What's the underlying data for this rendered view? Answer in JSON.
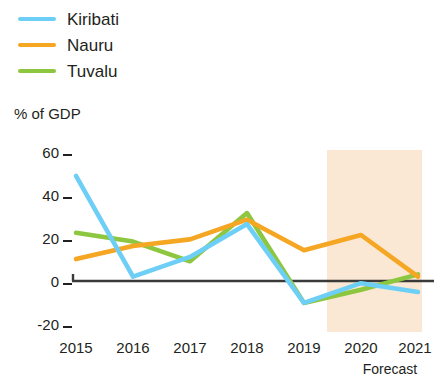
{
  "legend": {
    "items": [
      {
        "label": "Kiribati",
        "color": "#6ecff6"
      },
      {
        "label": "Nauru",
        "color": "#f5a623"
      },
      {
        "label": "Tuvalu",
        "color": "#8dc63f"
      }
    ]
  },
  "axis": {
    "unit_label": "% of GDP",
    "y_ticks": [
      "60",
      "40",
      "20",
      "0",
      "-20"
    ],
    "x_ticks": [
      "2015",
      "2016",
      "2017",
      "2018",
      "2019",
      "2020",
      "2021"
    ],
    "forecast_label": "Forecast"
  },
  "colors": {
    "kiribati": "#6ecff6",
    "nauru": "#f5a623",
    "tuvalu": "#8dc63f",
    "zero_axis": "#3a3a38",
    "forecast_band": "#fae8d4",
    "text": "#231f20"
  },
  "chart_data": {
    "type": "line",
    "title": "",
    "subtitle": "",
    "xlabel": "",
    "ylabel": "% of GDP",
    "categories": [
      "2015",
      "2016",
      "2017",
      "2018",
      "2019",
      "2020",
      "2021"
    ],
    "x": [
      2015,
      2016,
      2017,
      2018,
      2019,
      2020,
      2021
    ],
    "ylim": [
      -20,
      60
    ],
    "y_ticks": [
      -20,
      0,
      20,
      40,
      60
    ],
    "grid": false,
    "legend_position": "top-left",
    "annotations": [
      {
        "text": "Forecast",
        "x_start": 2019.5,
        "x_end": 2021,
        "type": "shaded-band"
      }
    ],
    "series": [
      {
        "name": "Kiribati",
        "color": "#6ecff6",
        "values": [
          48,
          2,
          11,
          26,
          -10,
          -1,
          -5
        ]
      },
      {
        "name": "Nauru",
        "color": "#f5a623",
        "values": [
          10,
          16,
          19,
          28,
          14,
          21,
          2
        ]
      },
      {
        "name": "Tuvalu",
        "color": "#8dc63f",
        "values": [
          22,
          18,
          9,
          31,
          -10,
          -4,
          3
        ]
      }
    ]
  }
}
